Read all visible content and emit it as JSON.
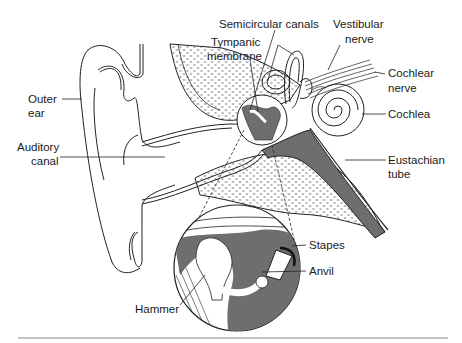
{
  "diagram": {
    "colors": {
      "line": "#222222",
      "shade": "#6e6e6e",
      "bone_dots": "#b5b5b5",
      "background": "#ffffff",
      "rule": "#888888"
    },
    "labels": {
      "outer_ear_1": "Outer",
      "outer_ear_2": "ear",
      "auditory_canal_1": "Auditory",
      "auditory_canal_2": "canal",
      "semicircular_canals": "Semicircular canals",
      "tympanic_membrane_1": "Tympanic",
      "tympanic_membrane_2": "membrane",
      "vestibular_nerve_1": "Vestibular",
      "vestibular_nerve_2": "nerve",
      "cochlear_nerve_1": "Cochlear",
      "cochlear_nerve_2": "nerve",
      "cochlea": "Cochlea",
      "eustachian_tube_1": "Eustachian",
      "eustachian_tube_2": "tube",
      "stapes": "Stapes",
      "anvil": "Anvil",
      "hammer": "Hammer"
    }
  }
}
